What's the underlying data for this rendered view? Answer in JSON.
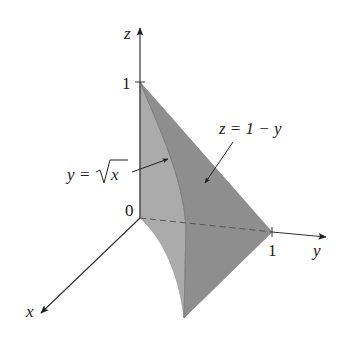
{
  "figure": {
    "type": "3d-solid-region",
    "axes": {
      "z_label": "z",
      "y_label": "y",
      "x_label": "x",
      "origin_label": "0",
      "z_tick_label": "1",
      "y_tick_label": "1"
    },
    "annotations": {
      "curve_label_lhs": "y",
      "curve_label_eq": "=",
      "curve_label_rhs": "x",
      "plane_label": "z = 1 − y"
    },
    "colors": {
      "light_face": "#ababab",
      "dark_face": "#8e8e8e",
      "axis": "#333333",
      "background": "#ffffff"
    }
  }
}
